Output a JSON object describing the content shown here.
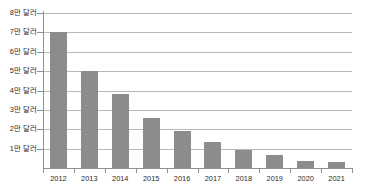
{
  "chart_data": {
    "type": "bar",
    "title": "",
    "xlabel": "",
    "ylabel": "",
    "categories": [
      "2012",
      "2013",
      "2014",
      "2015",
      "2016",
      "2017",
      "2018",
      "2019",
      "2020",
      "2021"
    ],
    "values": [
      70000,
      50000,
      38000,
      26000,
      19000,
      13500,
      9500,
      6500,
      3800,
      3200
    ],
    "unit_label": "만 달러",
    "ylim": [
      0,
      80000
    ],
    "ytick_values": [
      80000,
      70000,
      60000,
      50000,
      40000,
      30000,
      20000,
      10000
    ],
    "ytick_labels": [
      "8만 달러",
      "7만 달러",
      "6만 달러",
      "5만 달러",
      "4만 달러",
      "3만 달러",
      "2만 달러",
      "1만 달러"
    ],
    "grid": true,
    "legend": null,
    "bar_color": "#8c8c8c",
    "grid_color": "#b9b9b9",
    "axis_color": "#8f8f8f",
    "background_color": "#ffffff"
  },
  "axes": {
    "y": {
      "ticks": [
        {
          "label": "8만 달러",
          "value": 80000
        },
        {
          "label": "7만 달러",
          "value": 70000
        },
        {
          "label": "6만 달러",
          "value": 60000
        },
        {
          "label": "5만 달러",
          "value": 50000
        },
        {
          "label": "4만 달러",
          "value": 40000
        },
        {
          "label": "3만 달러",
          "value": 30000
        },
        {
          "label": "2만 달러",
          "value": 20000
        },
        {
          "label": "1만 달러",
          "value": 10000
        }
      ]
    },
    "x": {
      "ticks": [
        {
          "label": "2012"
        },
        {
          "label": "2013"
        },
        {
          "label": "2014"
        },
        {
          "label": "2015"
        },
        {
          "label": "2016"
        },
        {
          "label": "2017"
        },
        {
          "label": "2018"
        },
        {
          "label": "2019"
        },
        {
          "label": "2020"
        },
        {
          "label": "2021"
        }
      ]
    }
  }
}
